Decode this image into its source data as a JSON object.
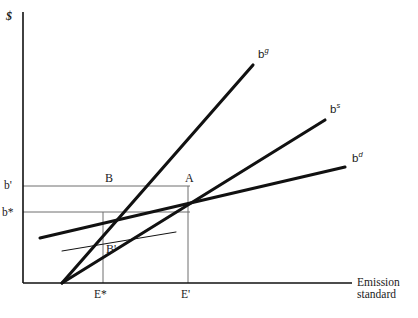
{
  "figure": {
    "domain": "diagram",
    "kind": "economics-line-diagram",
    "width": 418,
    "height": 318,
    "background_color": "#ffffff",
    "line_color": "#111111",
    "guide_color": "#6e6e6e",
    "text_color": "#1a1a1a"
  },
  "axes": {
    "y_label": "$",
    "x_label_line1": "Emission",
    "x_label_line2": "standard",
    "origin": {
      "x": 23,
      "y": 283
    },
    "y_axis": {
      "x": 23,
      "y_top": 12,
      "y_bottom": 283
    },
    "x_axis": {
      "y": 283,
      "x_left": 23,
      "x_right": 352
    }
  },
  "curves": [
    {
      "id": "bg",
      "label_base": "b",
      "label_sup": "g",
      "label_text": "b^g",
      "description": "steepest marginal benefit curve from origin",
      "x1": 62,
      "y1": 283,
      "x2": 253,
      "y2": 65,
      "stroke_width": 3.1,
      "label_x": 258,
      "label_y": 48
    },
    {
      "id": "bs",
      "label_base": "b",
      "label_sup": "s",
      "label_text": "b^s",
      "description": "intermediate slope curve from origin",
      "x1": 62,
      "y1": 283,
      "x2": 325,
      "y2": 120,
      "stroke_width": 3.1,
      "label_x": 330,
      "label_y": 103
    },
    {
      "id": "bd",
      "label_base": "b",
      "label_sup": "d",
      "label_text": "b^d",
      "description": "flattest curve crossing the vertical axis",
      "x1": 40,
      "y1": 238,
      "x2": 345,
      "y2": 167,
      "stroke_width": 3.1,
      "label_x": 352,
      "label_y": 152
    },
    {
      "id": "thin-aux",
      "label_text": "",
      "description": "thin auxiliary line through point B-prime",
      "x1": 62,
      "y1": 251,
      "x2": 176,
      "y2": 232,
      "stroke_width": 1.0,
      "label_x": null,
      "label_y": null
    }
  ],
  "guides": {
    "horizontal": [
      {
        "id": "b-prime-level",
        "y": 186,
        "x_from": 23,
        "x_to": 190
      },
      {
        "id": "b-star-level",
        "y": 212,
        "x_from": 23,
        "x_to": 190
      }
    ],
    "vertical": [
      {
        "id": "e-star-drop",
        "x": 103,
        "y_from": 212,
        "y_to": 283
      },
      {
        "id": "e-prime-drop",
        "x": 188,
        "y_from": 186,
        "y_to": 283
      }
    ]
  },
  "y_ticks": [
    {
      "label": "b'",
      "x": 4,
      "y": 179
    },
    {
      "label": "b*",
      "x": 2,
      "y": 206
    }
  ],
  "x_ticks": [
    {
      "label": "E*",
      "x": 94,
      "y": 288
    },
    {
      "label": "E'",
      "x": 181,
      "y": 288
    }
  ],
  "points": [
    {
      "label": "B",
      "x": 105,
      "y": 172,
      "at_x": 103,
      "at_y": 186
    },
    {
      "label": "A",
      "x": 185,
      "y": 172,
      "at_x": 188,
      "at_y": 186
    },
    {
      "label": "B'",
      "x": 106,
      "y": 243,
      "at_x": 103,
      "at_y": 252
    }
  ],
  "x_axis_label_pos": {
    "x": 357,
    "y": 276
  },
  "y_axis_label_pos": {
    "x": 6,
    "y": 10
  }
}
